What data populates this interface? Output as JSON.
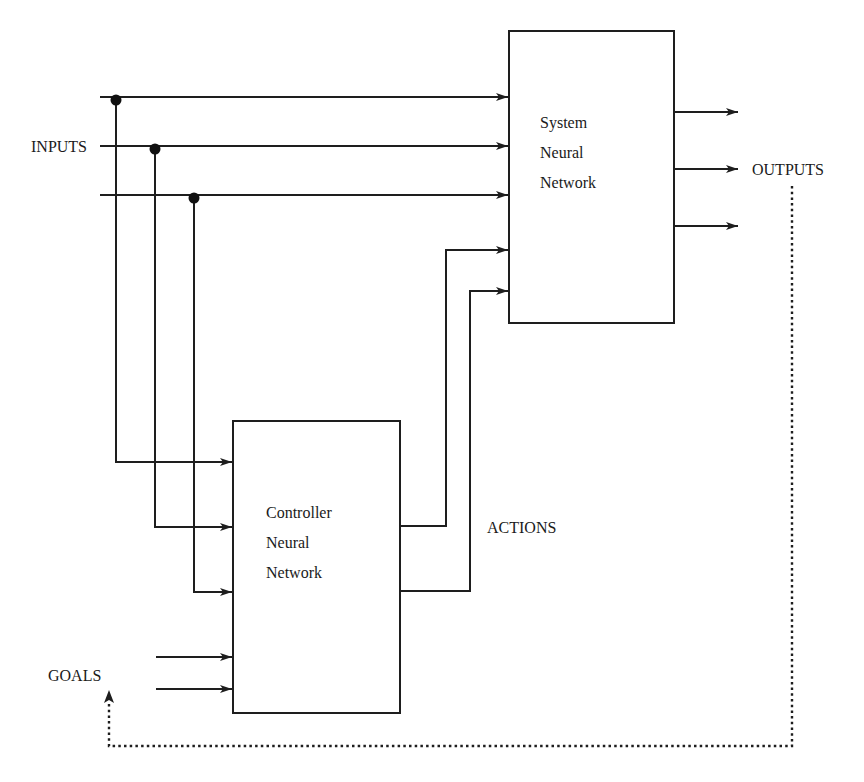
{
  "diagram": {
    "type": "block-diagram",
    "title": "",
    "blocks": {
      "system": {
        "lines": [
          "System",
          "Neural",
          "Network"
        ]
      },
      "controller": {
        "lines": [
          "Controller",
          "Neural",
          "Network"
        ]
      }
    },
    "labels": {
      "inputs": "INPUTS",
      "outputs": "OUTPUTS",
      "actions": "ACTIONS",
      "goals": "GOALS"
    },
    "connections": [
      {
        "from": "inputs",
        "to": "system",
        "count": 3,
        "style": "solid"
      },
      {
        "from": "inputs",
        "to": "controller",
        "count": 3,
        "style": "solid",
        "note": "branch taps from each input line"
      },
      {
        "from": "goals",
        "to": "controller",
        "count": 2,
        "style": "solid"
      },
      {
        "from": "controller",
        "to": "system",
        "count": 2,
        "style": "solid",
        "label": "ACTIONS"
      },
      {
        "from": "system",
        "to": "outputs",
        "count": 3,
        "style": "solid"
      },
      {
        "from": "outputs",
        "to": "goals",
        "count": 1,
        "style": "dotted",
        "note": "feedback"
      }
    ]
  }
}
